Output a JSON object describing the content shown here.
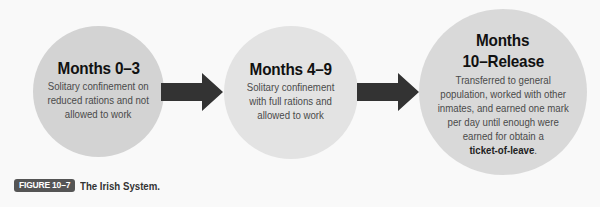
{
  "figure": {
    "label": "FIGURE 10–7",
    "caption": "The Irish System."
  },
  "stages": [
    {
      "title": "Months 0–3",
      "description_lines": [
        "Solitary confinement on",
        "reduced rations and not",
        "allowed to work"
      ],
      "fill_color": "#d3d3d3"
    },
    {
      "title": "Months 4–9",
      "description_lines": [
        "Solitary confinement",
        "with full rations and",
        "allowed to work"
      ],
      "fill_color": "#e3e3e3"
    },
    {
      "title_lines": [
        "Months",
        "10–Release"
      ],
      "description_lines": [
        "Transferred to general",
        "population, worked with other",
        "inmates, and earned one mark",
        "per day until enough were",
        "earned for obtain a"
      ],
      "emphasis_term": "ticket-of-leave",
      "emphasis_suffix": ".",
      "fill_color": "#d9d9d9"
    }
  ],
  "arrows": [
    {
      "from": 0,
      "to": 1,
      "icon": "right-arrow-icon",
      "color": "#333333"
    },
    {
      "from": 1,
      "to": 2,
      "icon": "right-arrow-icon",
      "color": "#333333"
    }
  ]
}
